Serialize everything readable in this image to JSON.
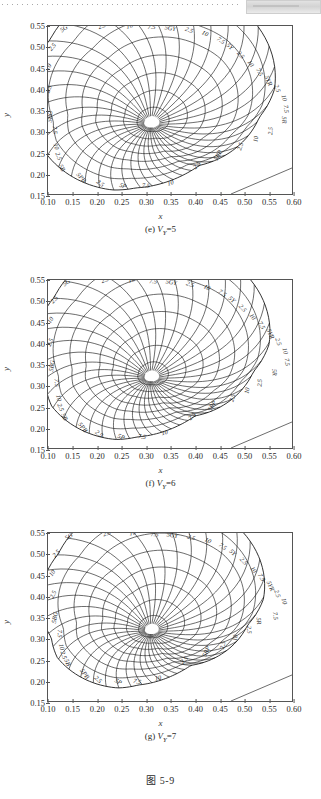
{
  "page": {
    "figure_number": "图 5-9",
    "axis_x_title": "x",
    "axis_y_title": "y"
  },
  "axes": {
    "x_ticks": [
      "0.10",
      "0.15",
      "0.20",
      "0.25",
      "0.30",
      "0.35",
      "0.40",
      "0.45",
      "0.50",
      "0.55",
      "0.60"
    ],
    "y_ticks": [
      "0.55",
      "0.50",
      "0.45",
      "0.40",
      "0.35",
      "0.30",
      "0.25",
      "0.20",
      "0.15"
    ],
    "x_range": [
      0.1,
      0.6
    ],
    "y_range": [
      0.15,
      0.55
    ]
  },
  "panels": [
    {
      "id": "e",
      "caption_index": "(e)",
      "caption_symbol": "V",
      "caption_subscript": "Y",
      "caption_value": "=5",
      "caption_full": "(e) VY=5",
      "value_level": 5
    },
    {
      "id": "f",
      "caption_index": "(f)",
      "caption_symbol": "V",
      "caption_subscript": "Y",
      "caption_value": "=6",
      "caption_full": "(f) VY=6",
      "value_level": 6
    },
    {
      "id": "g",
      "caption_index": "(g)",
      "caption_symbol": "V",
      "caption_subscript": "Y",
      "caption_value": "=7",
      "caption_full": "(g) VY=7",
      "value_level": 7
    }
  ],
  "chart_data": [
    {
      "type": "line",
      "title": "(e) VY=5",
      "xlabel": "x",
      "ylabel": "y",
      "xlim": [
        0.1,
        0.6
      ],
      "ylim": [
        0.15,
        0.55
      ],
      "grid": false,
      "legend": "none",
      "description": "Munsell constant-value chromaticity chart at Value 5: radial hue lines and closed chroma contours about the achromatic point.",
      "white_point": [
        0.3101,
        0.3162
      ],
      "hue_labels": [
        {
          "text": "5G",
          "x": 0.135,
          "y": 0.54
        },
        {
          "text": "2.5",
          "x": 0.112,
          "y": 0.497
        },
        {
          "text": "10",
          "x": 0.104,
          "y": 0.45
        },
        {
          "text": "2.5",
          "x": 0.105,
          "y": 0.398
        },
        {
          "text": "5BG",
          "x": 0.108,
          "y": 0.334
        },
        {
          "text": "7.5",
          "x": 0.11,
          "y": 0.302
        },
        {
          "text": "10",
          "x": 0.113,
          "y": 0.262
        },
        {
          "text": "2.5",
          "x": 0.118,
          "y": 0.238
        },
        {
          "text": "5B",
          "x": 0.125,
          "y": 0.21
        },
        {
          "text": "2.5",
          "x": 0.212,
          "y": 0.546
        },
        {
          "text": "10",
          "x": 0.268,
          "y": 0.545
        },
        {
          "text": "7.5",
          "x": 0.312,
          "y": 0.543
        },
        {
          "text": "5GY",
          "x": 0.35,
          "y": 0.54
        },
        {
          "text": "2.5",
          "x": 0.388,
          "y": 0.536
        },
        {
          "text": "10",
          "x": 0.42,
          "y": 0.528
        },
        {
          "text": "7.5",
          "x": 0.452,
          "y": 0.512
        },
        {
          "text": "5Y",
          "x": 0.47,
          "y": 0.498
        },
        {
          "text": "2.5",
          "x": 0.492,
          "y": 0.478
        },
        {
          "text": "10",
          "x": 0.512,
          "y": 0.458
        },
        {
          "text": "7.5",
          "x": 0.53,
          "y": 0.438
        },
        {
          "text": "5YR",
          "x": 0.548,
          "y": 0.418
        },
        {
          "text": "2.5",
          "x": 0.566,
          "y": 0.4
        },
        {
          "text": "10",
          "x": 0.58,
          "y": 0.378
        },
        {
          "text": "7.5",
          "x": 0.584,
          "y": 0.352
        },
        {
          "text": "5R",
          "x": 0.58,
          "y": 0.326
        },
        {
          "text": "2.5",
          "x": 0.56,
          "y": 0.3
        },
        {
          "text": "10",
          "x": 0.53,
          "y": 0.28
        },
        {
          "text": "2.5",
          "x": 0.498,
          "y": 0.262
        },
        {
          "text": "5RP",
          "x": 0.452,
          "y": 0.24
        },
        {
          "text": "2.5",
          "x": 0.408,
          "y": 0.215
        },
        {
          "text": "10",
          "x": 0.352,
          "y": 0.172
        },
        {
          "text": "7.5",
          "x": 0.3,
          "y": 0.165
        },
        {
          "text": "5P",
          "x": 0.252,
          "y": 0.165
        },
        {
          "text": "2.5",
          "x": 0.205,
          "y": 0.172
        },
        {
          "text": "5PB",
          "x": 0.165,
          "y": 0.186
        }
      ],
      "chroma_contours": [
        2,
        4,
        6,
        8,
        10,
        12,
        14,
        16
      ],
      "hue_line_count": 40
    },
    {
      "type": "line",
      "title": "(f) VY=6",
      "xlabel": "x",
      "ylabel": "y",
      "xlim": [
        0.1,
        0.6
      ],
      "ylim": [
        0.15,
        0.55
      ],
      "grid": false,
      "legend": "none",
      "description": "Munsell constant-value chromaticity chart at Value 6: radial hue lines and closed chroma contours about the achromatic point.",
      "white_point": [
        0.3101,
        0.3162
      ],
      "hue_labels": [
        {
          "text": "5G",
          "x": 0.14,
          "y": 0.54
        },
        {
          "text": "2.5",
          "x": 0.116,
          "y": 0.5
        },
        {
          "text": "10",
          "x": 0.108,
          "y": 0.452
        },
        {
          "text": "2.5",
          "x": 0.108,
          "y": 0.4
        },
        {
          "text": "5BG",
          "x": 0.112,
          "y": 0.345
        },
        {
          "text": "7.5",
          "x": 0.114,
          "y": 0.305
        },
        {
          "text": "10",
          "x": 0.118,
          "y": 0.268
        },
        {
          "text": "2.5",
          "x": 0.122,
          "y": 0.245
        },
        {
          "text": "5B",
          "x": 0.13,
          "y": 0.222
        },
        {
          "text": "2.5",
          "x": 0.218,
          "y": 0.546
        },
        {
          "text": "10",
          "x": 0.272,
          "y": 0.545
        },
        {
          "text": "7.5",
          "x": 0.315,
          "y": 0.542
        },
        {
          "text": "5GY",
          "x": 0.352,
          "y": 0.54
        },
        {
          "text": "2.5",
          "x": 0.39,
          "y": 0.535
        },
        {
          "text": "10",
          "x": 0.424,
          "y": 0.528
        },
        {
          "text": "7.5",
          "x": 0.455,
          "y": 0.515
        },
        {
          "text": "5Y",
          "x": 0.474,
          "y": 0.5
        },
        {
          "text": "2.5",
          "x": 0.496,
          "y": 0.48
        },
        {
          "text": "10",
          "x": 0.516,
          "y": 0.46
        },
        {
          "text": "7.5",
          "x": 0.534,
          "y": 0.44
        },
        {
          "text": "5YR",
          "x": 0.552,
          "y": 0.42
        },
        {
          "text": "2.5",
          "x": 0.568,
          "y": 0.402
        },
        {
          "text": "10",
          "x": 0.582,
          "y": 0.38
        },
        {
          "text": "7.5",
          "x": 0.586,
          "y": 0.354
        },
        {
          "text": "5R",
          "x": 0.56,
          "y": 0.33
        },
        {
          "text": "2.5",
          "x": 0.538,
          "y": 0.305
        },
        {
          "text": "10",
          "x": 0.512,
          "y": 0.286
        },
        {
          "text": "2.5",
          "x": 0.482,
          "y": 0.268
        },
        {
          "text": "5RP",
          "x": 0.44,
          "y": 0.248
        },
        {
          "text": "2.5",
          "x": 0.398,
          "y": 0.222
        },
        {
          "text": "10",
          "x": 0.34,
          "y": 0.182
        },
        {
          "text": "7.5",
          "x": 0.292,
          "y": 0.172
        },
        {
          "text": "5P",
          "x": 0.248,
          "y": 0.172
        },
        {
          "text": "2.5",
          "x": 0.202,
          "y": 0.18
        },
        {
          "text": "5PB",
          "x": 0.168,
          "y": 0.196
        }
      ],
      "chroma_contours": [
        2,
        4,
        6,
        8,
        10,
        12,
        14,
        16
      ],
      "hue_line_count": 40
    },
    {
      "type": "line",
      "title": "(g) VY=7",
      "xlabel": "x",
      "ylabel": "y",
      "xlim": [
        0.1,
        0.6
      ],
      "ylim": [
        0.15,
        0.55
      ],
      "grid": false,
      "legend": "none",
      "description": "Munsell constant-value chromaticity chart at Value 7: radial hue lines and closed chroma contours about the achromatic point.",
      "white_point": [
        0.3101,
        0.3162
      ],
      "hue_labels": [
        {
          "text": "5G",
          "x": 0.145,
          "y": 0.538
        },
        {
          "text": "2.5",
          "x": 0.12,
          "y": 0.498
        },
        {
          "text": "10",
          "x": 0.112,
          "y": 0.452
        },
        {
          "text": "2.5",
          "x": 0.114,
          "y": 0.402
        },
        {
          "text": "5BG",
          "x": 0.118,
          "y": 0.348
        },
        {
          "text": "7.5",
          "x": 0.12,
          "y": 0.31
        },
        {
          "text": "10",
          "x": 0.124,
          "y": 0.278
        },
        {
          "text": "2.5",
          "x": 0.128,
          "y": 0.258
        },
        {
          "text": "5B",
          "x": 0.136,
          "y": 0.24
        },
        {
          "text": "2.5",
          "x": 0.222,
          "y": 0.545
        },
        {
          "text": "10",
          "x": 0.274,
          "y": 0.545
        },
        {
          "text": "7.5",
          "x": 0.318,
          "y": 0.542
        },
        {
          "text": "5GY",
          "x": 0.354,
          "y": 0.54
        },
        {
          "text": "2.5",
          "x": 0.392,
          "y": 0.535
        },
        {
          "text": "10",
          "x": 0.426,
          "y": 0.528
        },
        {
          "text": "7.5",
          "x": 0.456,
          "y": 0.514
        },
        {
          "text": "5Y",
          "x": 0.476,
          "y": 0.5
        },
        {
          "text": "2.5",
          "x": 0.498,
          "y": 0.48
        },
        {
          "text": "10",
          "x": 0.518,
          "y": 0.46
        },
        {
          "text": "7.5",
          "x": 0.534,
          "y": 0.442
        },
        {
          "text": "5YR",
          "x": 0.552,
          "y": 0.422
        },
        {
          "text": "2.5",
          "x": 0.566,
          "y": 0.404
        },
        {
          "text": "10",
          "x": 0.58,
          "y": 0.386
        },
        {
          "text": "7.5",
          "x": 0.562,
          "y": 0.352
        },
        {
          "text": "5R",
          "x": 0.528,
          "y": 0.34
        },
        {
          "text": "2.5",
          "x": 0.508,
          "y": 0.32
        },
        {
          "text": "10",
          "x": 0.488,
          "y": 0.3
        },
        {
          "text": "2.5",
          "x": 0.462,
          "y": 0.282
        },
        {
          "text": "5RP",
          "x": 0.428,
          "y": 0.266
        },
        {
          "text": "2.5",
          "x": 0.382,
          "y": 0.244
        },
        {
          "text": "10",
          "x": 0.326,
          "y": 0.2
        },
        {
          "text": "7.5",
          "x": 0.282,
          "y": 0.192
        },
        {
          "text": "5P",
          "x": 0.242,
          "y": 0.192
        },
        {
          "text": "2.5",
          "x": 0.2,
          "y": 0.198
        },
        {
          "text": "5PB",
          "x": 0.172,
          "y": 0.212
        }
      ],
      "chroma_contours": [
        2,
        4,
        6,
        8,
        10,
        12,
        14,
        16
      ],
      "hue_line_count": 40
    }
  ]
}
